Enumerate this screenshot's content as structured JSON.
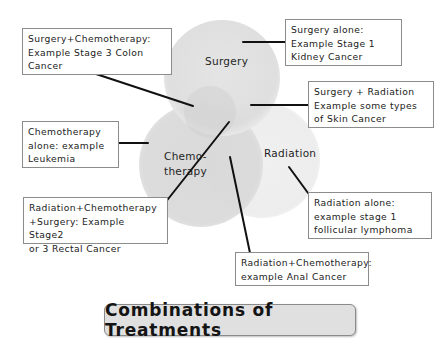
{
  "diagram": {
    "type": "venn",
    "title": "Combinations of Treatments",
    "circles": [
      {
        "id": "surgery",
        "label": "Surgery",
        "color": "#dddddd"
      },
      {
        "id": "chemotherapy",
        "label": "Chemo-\ntherapy",
        "color": "#d9d9d9"
      },
      {
        "id": "radiation",
        "label": "Radiation",
        "color": "#ededed"
      }
    ],
    "overlap_color": "#cbcbcb",
    "callouts": [
      {
        "id": "surgery-chemo",
        "text": "Surgery+Chemotherapy:\nExample Stage 3 Colon\nCancer"
      },
      {
        "id": "surgery-alone",
        "text": "Surgery alone:\nExample Stage 1\nKidney Cancer"
      },
      {
        "id": "surgery-radiation",
        "text": "Surgery + Radiation\nExample some types\nof Skin Cancer"
      },
      {
        "id": "chemo-alone",
        "text": "Chemotherapy\nalone: example\nLeukemia"
      },
      {
        "id": "all-three",
        "text": "Radiation+Chemotherapy\n+Surgery: Example Stage2\nor 3 Rectal Cancer"
      },
      {
        "id": "radiation-alone",
        "text": "Radiation alone:\nexample stage 1\nfollicular lymphoma"
      },
      {
        "id": "radiation-chemo",
        "text": "Radiation+Chemotherapy:\nexample Anal Cancer"
      }
    ]
  }
}
